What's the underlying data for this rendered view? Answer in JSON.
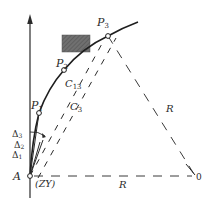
{
  "diagram": {
    "type": "circular-curve-deflection-layout",
    "colors": {
      "line": "#2a2a2a",
      "dashed": "#3a3a3a",
      "obstacle_fill": "#6e6e6e",
      "background": "#ffffff"
    },
    "points": {
      "A": {
        "label": "A",
        "sub_label": "(ZY)"
      },
      "P1": {
        "label": "P",
        "sub": "1"
      },
      "P2": {
        "label": "P",
        "sub": "2"
      },
      "P3": {
        "label": "P",
        "sub": "3"
      },
      "O": {
        "label": "0"
      }
    },
    "chords": {
      "C13": {
        "label": "C",
        "sub": "13"
      },
      "C3": {
        "label": "C",
        "sub": "3"
      }
    },
    "deflection_angles": [
      {
        "label": "Δ",
        "sub": "1"
      },
      {
        "label": "Δ",
        "sub": "2"
      },
      {
        "label": "Δ",
        "sub": "3"
      }
    ],
    "radii": [
      {
        "label": "R",
        "from": "A",
        "to": "O"
      },
      {
        "label": "R",
        "from": "P3",
        "to": "O"
      }
    ],
    "obstacle": {
      "description": "shaded rectangle obstacle near P3"
    }
  }
}
